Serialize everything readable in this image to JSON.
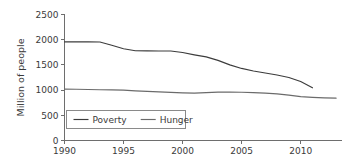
{
  "chart_data": {
    "type": "line",
    "title": "",
    "xlabel": "",
    "ylabel": "Million of people",
    "xlim": [
      1990,
      2013.5
    ],
    "ylim": [
      0,
      2500
    ],
    "grid": false,
    "legend_position": "lower-left-inside",
    "xticks": [
      1990,
      1995,
      2000,
      2005,
      2010
    ],
    "xtick_labels": [
      "1990",
      "1995",
      "2000",
      "2005",
      "2010"
    ],
    "yticks": [
      0,
      500,
      1000,
      1500,
      2000,
      2500
    ],
    "ytick_labels": [
      "0",
      "500",
      "1000",
      "1500",
      "2000",
      "2500"
    ],
    "series": [
      {
        "name": "Poverty",
        "color": "#3c3c3c",
        "x": [
          1990,
          1991,
          1992,
          1993,
          1994,
          1995,
          1996,
          1997,
          1998,
          1999,
          2000,
          2001,
          2002,
          2003,
          2004,
          2005,
          2006,
          2007,
          2008,
          2009,
          2010,
          2011
        ],
        "values": [
          1958,
          1958,
          1958,
          1955,
          1890,
          1820,
          1780,
          1778,
          1776,
          1775,
          1745,
          1700,
          1660,
          1590,
          1500,
          1430,
          1380,
          1340,
          1300,
          1250,
          1170,
          1045
        ]
      },
      {
        "name": "Hunger",
        "color": "#6b6b6b",
        "x": [
          1990,
          1991,
          1992,
          1993,
          1994,
          1995,
          1996,
          1997,
          1998,
          1999,
          2000,
          2001,
          2002,
          2003,
          2004,
          2005,
          2006,
          2007,
          2008,
          2009,
          2010,
          2011,
          2012,
          2013
        ],
        "values": [
          1020,
          1016,
          1012,
          1008,
          1005,
          1000,
          985,
          975,
          965,
          955,
          945,
          940,
          950,
          960,
          962,
          958,
          950,
          940,
          925,
          900,
          870,
          855,
          845,
          840
        ]
      }
    ]
  },
  "legend": {
    "entries": [
      {
        "label": "Poverty"
      },
      {
        "label": "Hunger"
      }
    ]
  },
  "axes": {
    "y_axis_title": "Million of people"
  }
}
